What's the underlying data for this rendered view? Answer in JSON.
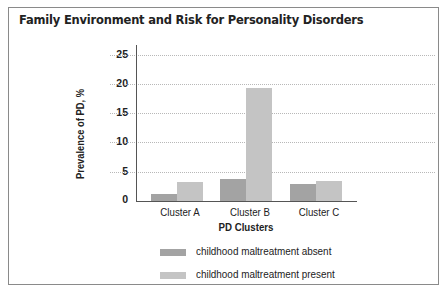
{
  "title": "Family Environment and Risk for Personality Disorders",
  "colors": {
    "absent": "#a3a3a3",
    "present": "#c4c4c4"
  },
  "chart_data": {
    "type": "bar",
    "title": "Family Environment and Risk for Personality Disorders",
    "xlabel": "PD Clusters",
    "ylabel": "Prevalence of PD, %",
    "ylim": [
      0,
      25
    ],
    "yticks": [
      "25",
      "20",
      "15",
      "10",
      "5",
      "0"
    ],
    "grid": true,
    "legend_position": "bottom",
    "categories": [
      "Cluster A",
      "Cluster B",
      "Cluster C"
    ],
    "series": [
      {
        "name": "childhood maltreatment absent",
        "values": [
          1.2,
          3.8,
          2.9
        ]
      },
      {
        "name": "childhood maltreatment present",
        "values": [
          3.3,
          19.5,
          3.4
        ]
      }
    ]
  }
}
